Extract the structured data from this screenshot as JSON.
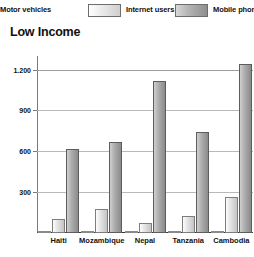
{
  "legend": {
    "items": [
      {
        "label": "Motor vehicles",
        "swatch": "motor-vehicles-swatch",
        "color": "#f2f2f2"
      },
      {
        "label": "Internet users",
        "swatch": "internet-users-swatch",
        "color": "#e0e0e0"
      },
      {
        "label": "Mobile phones",
        "swatch": "mobile-phones-swatch",
        "color": "#aeaeae"
      }
    ]
  },
  "title": "Low Income",
  "axis": {
    "y_ticks": [
      "300",
      "600",
      "900",
      "1.200"
    ]
  },
  "chart_data": {
    "type": "bar",
    "title": "Low Income",
    "xlabel": "",
    "ylabel": "",
    "ylim": [
      0,
      1300
    ],
    "grid": true,
    "legend_position": "top",
    "categories": [
      "Haiti",
      "Mozambique",
      "Nepal",
      "Tanzania",
      "Cambodia"
    ],
    "ytick_labels": [
      "300",
      "600",
      "900",
      "1.200"
    ],
    "ytick_values": [
      300,
      600,
      900,
      1200
    ],
    "series": [
      {
        "name": "Motor vehicles",
        "color": "#f2f2f2",
        "values": [
          5,
          8,
          6,
          7,
          10
        ]
      },
      {
        "name": "Internet users",
        "color": "#e0e0e0",
        "values": [
          100,
          180,
          75,
          125,
          265
        ]
      },
      {
        "name": "Mobile phones",
        "color": "#aeaeae",
        "values": [
          615,
          670,
          1120,
          740,
          1240
        ]
      }
    ]
  }
}
